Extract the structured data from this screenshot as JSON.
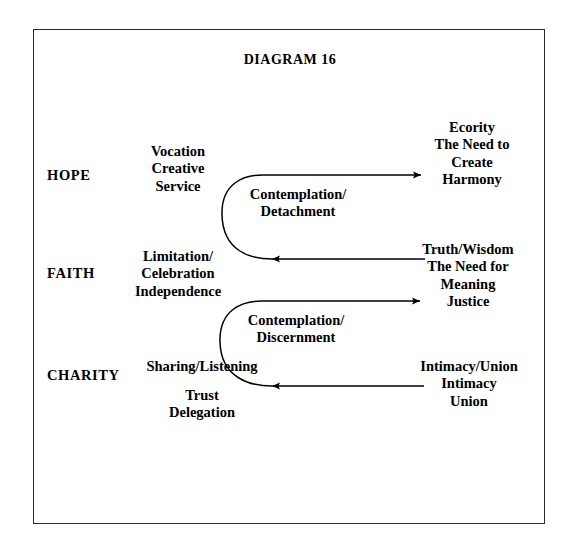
{
  "document": {
    "title": "DIAGRAM 16",
    "background_color": "#ffffff",
    "ink_color": "#000000",
    "border_color": "#2b2b2b"
  },
  "rows": [
    {
      "virtue": "HOPE",
      "left_block": "Vocation\nCreative\nService",
      "right_block": "Ecority\nThe Need to\nCreate\nHarmony"
    },
    {
      "virtue": "FAITH",
      "left_block": "Limitation/\nCelebration\nIndependence",
      "right_block": "Truth/Wisdom\nThe Need for\nMeaning\nJustice"
    },
    {
      "virtue": "CHARITY",
      "left_block": "Sharing/Listening",
      "left_block_lower": "Trust\nDelegation",
      "right_block": "Intimacy/Union\nIntimacy\nUnion"
    }
  ],
  "curve_labels": [
    "Contemplation/\nDetachment",
    "Contemplation/\nDiscernment"
  ]
}
